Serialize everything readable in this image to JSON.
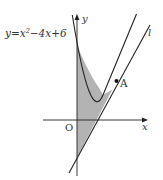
{
  "diagram": {
    "curve_label": "y = x² − 4x + 6",
    "curve_label_parts": {
      "pre": "y",
      "eq": "=",
      "x2": "x",
      "sup": "2",
      "rest": "−4x+6"
    },
    "line_label": "l",
    "point_label": "A",
    "origin_label": "O",
    "x_axis_label": "x",
    "y_axis_label": "y",
    "colors": {
      "stroke": "#222222",
      "fill": "#b0b0b0"
    },
    "math": {
      "parabola": "y = x^2 - 4x + 6",
      "tangent_point": [
        3,
        3
      ],
      "tangent_line": "y = 2x - 3",
      "shaded_region": "between parabola, tangent line l and y-axis, x from 0 to 3"
    }
  }
}
